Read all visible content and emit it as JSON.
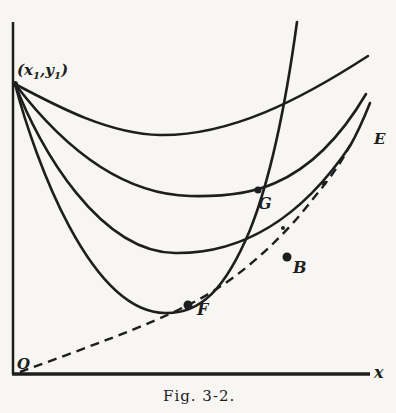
{
  "figure": {
    "caption": "Fig. 3-2.",
    "axes": {
      "x_label": "x",
      "origin_label": "O"
    },
    "start_point_label": "(x1,y1)",
    "start_point": {
      "x_sub": "1",
      "y_sub": "1",
      "x_var": "x",
      "y_var": "y"
    },
    "points": [
      {
        "id": "G",
        "label": "G"
      },
      {
        "id": "F",
        "label": "F"
      },
      {
        "id": "B",
        "label": "B"
      },
      {
        "id": "E",
        "label": "E"
      }
    ],
    "curves": [
      {
        "name": "curve-1",
        "style": "solid"
      },
      {
        "name": "curve-2",
        "style": "solid"
      },
      {
        "name": "curve-3",
        "style": "solid"
      },
      {
        "name": "curve-4",
        "style": "solid"
      },
      {
        "name": "envelope",
        "style": "dashed"
      }
    ],
    "colors": {
      "ink": "#1e1e1e",
      "paper": "#f7f6f2"
    }
  }
}
